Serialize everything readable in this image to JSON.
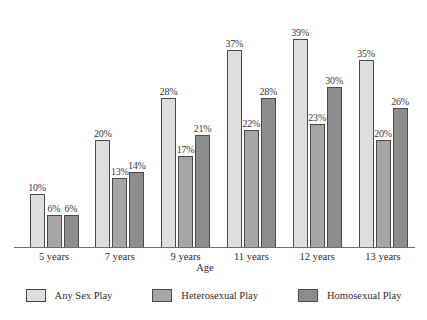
{
  "chart_data": {
    "type": "bar",
    "title": "",
    "subtitle": "",
    "xlabel": "Age",
    "ylabel": "",
    "ylim": [
      0,
      45
    ],
    "grid": false,
    "legend_position": "bottom",
    "value_suffix": "%",
    "categories": [
      "5 years",
      "7 years",
      "9 years",
      "11 years",
      "12 years",
      "13 years"
    ],
    "series": [
      {
        "name": "Any Sex Play",
        "color": "#dedede",
        "values": [
          10,
          20,
          28,
          37,
          39,
          35
        ],
        "labels": [
          "10%",
          "20%",
          "28%",
          "37%",
          "39%",
          "35%"
        ]
      },
      {
        "name": "Heterosexual Play",
        "color": "#a6a6a6",
        "values": [
          6,
          13,
          17,
          22,
          23,
          20
        ],
        "labels": [
          "6%",
          "13%",
          "17%",
          "22%",
          "23%",
          "20%"
        ]
      },
      {
        "name": "Homosexual Play",
        "color": "#8d8d8d",
        "values": [
          6,
          14,
          21,
          28,
          30,
          26
        ],
        "labels": [
          "6%",
          "14%",
          "21%",
          "28%",
          "30%",
          "26%"
        ]
      }
    ]
  }
}
